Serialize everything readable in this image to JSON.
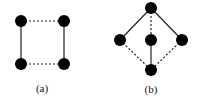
{
  "figures": [
    {
      "id": "a",
      "caption": "(a)",
      "caption_pos": [
        42,
        82
      ],
      "nodes": [
        {
          "id": "tl",
          "x": 21,
          "y": 21
        },
        {
          "id": "tr",
          "x": 64,
          "y": 21
        },
        {
          "id": "bl",
          "x": 21,
          "y": 64
        },
        {
          "id": "br",
          "x": 64,
          "y": 64
        }
      ],
      "edges": [
        {
          "from": "tl",
          "to": "tr",
          "style": "dashed"
        },
        {
          "from": "bl",
          "to": "br",
          "style": "dashed"
        },
        {
          "from": "tl",
          "to": "bl",
          "style": "solid"
        },
        {
          "from": "tr",
          "to": "br",
          "style": "solid"
        }
      ]
    },
    {
      "id": "b",
      "caption": "(b)",
      "caption_pos": [
        151,
        83
      ],
      "nodes": [
        {
          "id": "top",
          "x": 151,
          "y": 8
        },
        {
          "id": "left",
          "x": 120,
          "y": 40
        },
        {
          "id": "mid",
          "x": 151,
          "y": 40
        },
        {
          "id": "right",
          "x": 182,
          "y": 40
        },
        {
          "id": "bottom",
          "x": 151,
          "y": 70
        }
      ],
      "edges": [
        {
          "from": "top",
          "to": "left",
          "style": "solid"
        },
        {
          "from": "top",
          "to": "right",
          "style": "solid"
        },
        {
          "from": "top",
          "to": "mid",
          "style": "dashed"
        },
        {
          "from": "mid",
          "to": "bottom",
          "style": "solid"
        },
        {
          "from": "left",
          "to": "bottom",
          "style": "dashed"
        },
        {
          "from": "right",
          "to": "bottom",
          "style": "dashed"
        }
      ]
    }
  ],
  "style": {
    "node_color": "#000000",
    "edge_color": "#222222",
    "node_radius": 6
  }
}
